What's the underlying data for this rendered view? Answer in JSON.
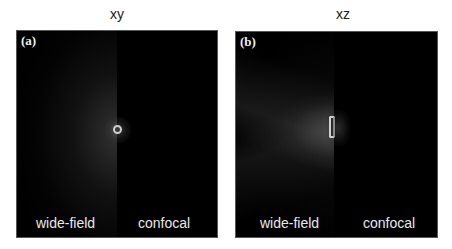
{
  "figure": {
    "panels": [
      {
        "tag": "(a)",
        "title": "xy",
        "left_label": "wide-field",
        "right_label": "confocal",
        "shape": "ring-spot"
      },
      {
        "tag": "(b)",
        "title": "xz",
        "left_label": "wide-field",
        "right_label": "confocal",
        "shape": "hourglass-spot"
      }
    ],
    "colors": {
      "background": "#000000",
      "text": "#e8e8e8",
      "page": "#ffffff"
    }
  }
}
